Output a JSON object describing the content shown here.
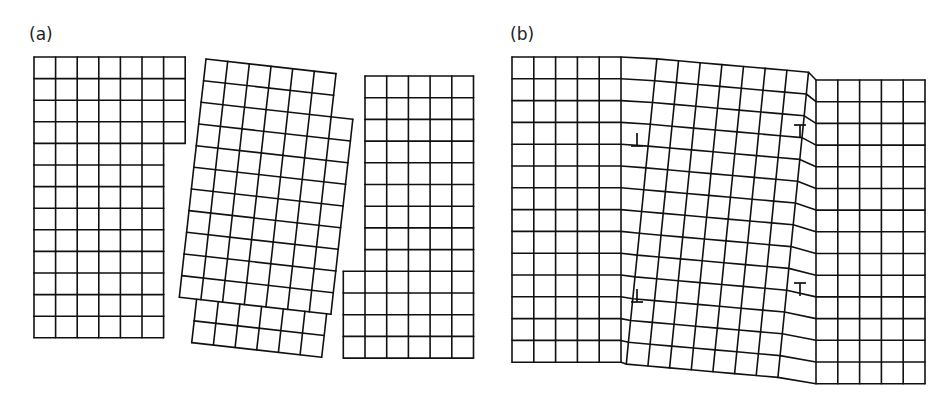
{
  "figure": {
    "panels": [
      {
        "id": "a",
        "label": "(a)",
        "description": "Three separate crystal grains shown as square lattices before joining; middle grain rotated",
        "grains": [
          {
            "name": "left-grain",
            "origin": [
              34,
              57
            ],
            "cell": 21.6,
            "angle_deg": 0,
            "rows": [
              7,
              7,
              7,
              7,
              6,
              6,
              6,
              6,
              6,
              6,
              6,
              6,
              6
            ],
            "row_offsets": [
              0,
              0,
              0,
              0,
              0,
              0,
              0,
              0,
              0,
              0,
              0,
              0,
              0
            ]
          },
          {
            "name": "middle-grain-rotated",
            "origin": [
              206,
              59
            ],
            "cell": 21.8,
            "angle_deg": 6.4,
            "rows": [
              6,
              6,
              7,
              7,
              7,
              7,
              7,
              7,
              7,
              7,
              7,
              6,
              6
            ],
            "row_offsets": [
              0,
              0,
              0,
              0,
              0,
              0,
              0,
              0,
              0,
              0,
              0,
              0.8,
              0.8
            ]
          },
          {
            "name": "right-grain",
            "origin": [
              365,
              76
            ],
            "cell": 21.7,
            "angle_deg": 0,
            "rows": [
              5,
              5,
              5,
              5,
              5,
              5,
              5,
              5,
              5,
              6,
              6,
              6,
              6
            ],
            "row_offsets": [
              0,
              0,
              0,
              0,
              0,
              0,
              0,
              0,
              0,
              -1,
              -1,
              -1,
              -1
            ]
          }
        ]
      },
      {
        "id": "b",
        "label": "(b)",
        "description": "Grains joined into a continuous lattice with a tilted middle region bounded by low-angle grain boundaries made of edge dislocations",
        "lattice": {
          "left_x": 512,
          "top_y": 57,
          "cols": 19,
          "rows": 14,
          "cell": 21.8,
          "tilt_start_col": 5,
          "tilt_end_col": 14,
          "tilt_angle_deg": 6.4,
          "right_shift_y": 23
        },
        "dislocations": [
          {
            "symbol": "⊥",
            "x": 637,
            "y": 146,
            "orientation": "up"
          },
          {
            "symbol": "⊥",
            "x": 637,
            "y": 302,
            "orientation": "up"
          },
          {
            "symbol": "⊤",
            "x": 800,
            "y": 125,
            "orientation": "down"
          },
          {
            "symbol": "⊤",
            "x": 800,
            "y": 283,
            "orientation": "down"
          }
        ]
      }
    ]
  }
}
